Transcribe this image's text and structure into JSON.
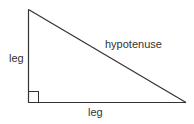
{
  "diagram": {
    "type": "right-triangle",
    "vertices": {
      "top": [
        28.5,
        9.5
      ],
      "right_angle": [
        28.5,
        102.5
      ],
      "right": [
        186,
        102.5
      ]
    },
    "right_angle_marker_size": 10,
    "stroke_color": "#333333",
    "labels": {
      "vertical_leg": "leg",
      "horizontal_leg": "leg",
      "hypotenuse": "hypotenuse"
    }
  }
}
